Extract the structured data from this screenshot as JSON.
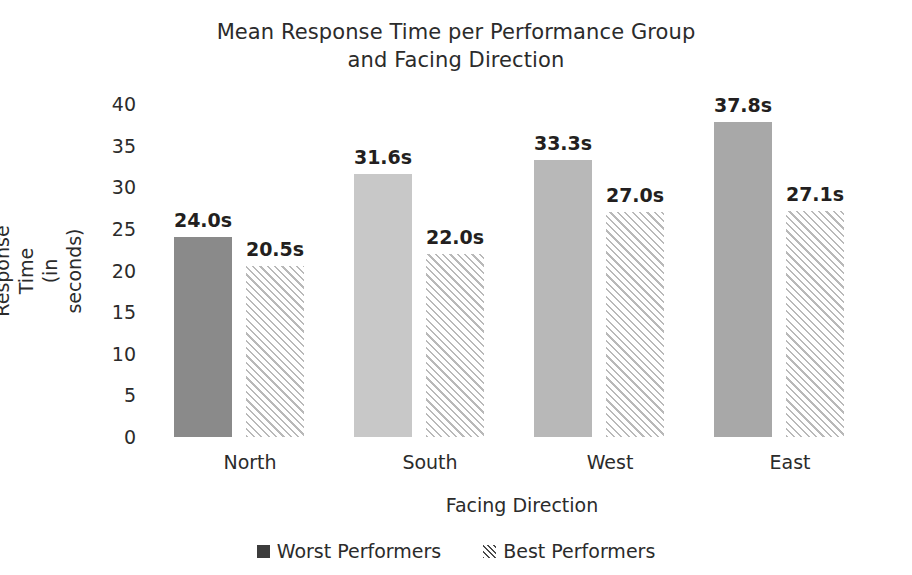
{
  "chart_data": {
    "type": "bar",
    "title": "Mean Response Time per Performance Group\nand Facing Direction",
    "xlabel": "Facing Direction",
    "ylabel": "Response Time\n(in seconds)",
    "categories": [
      "North",
      "South",
      "West",
      "East"
    ],
    "series": [
      {
        "name": "Worst Performers",
        "values": [
          24.0,
          31.6,
          33.3,
          37.8
        ],
        "labels": [
          "24.0s",
          "31.6s",
          "33.3s",
          "27.1s"
        ],
        "value_labels": [
          "24.0s",
          "31.6s",
          "33.3s",
          "37.8s"
        ],
        "bar_colors": [
          "#8a8a8a",
          "#c8c8c8",
          "#b8b8b8",
          "#a8a8a8"
        ],
        "pattern": "solid"
      },
      {
        "name": "Best Performers",
        "values": [
          20.5,
          22.0,
          27.0,
          27.1
        ],
        "value_labels": [
          "20.5s",
          "22.0s",
          "27.0s",
          "27.1s"
        ],
        "bar_colors": [
          "#ffffff",
          "#ffffff",
          "#ffffff",
          "#ffffff"
        ],
        "pattern": "diagonal-hatch"
      }
    ],
    "yticks": [
      40,
      35,
      30,
      25,
      20,
      15,
      10,
      5,
      0
    ],
    "ytick_labels": [
      "40",
      "35",
      "30",
      "25",
      "20",
      "15",
      "10",
      "5",
      "0"
    ],
    "ylim": [
      0,
      40
    ],
    "grid": false,
    "legend_position": "bottom-center",
    "legend": [
      {
        "label": "Worst Performers",
        "marker": "solid-square"
      },
      {
        "label": "Best Performers",
        "marker": "hatched-square"
      }
    ]
  }
}
